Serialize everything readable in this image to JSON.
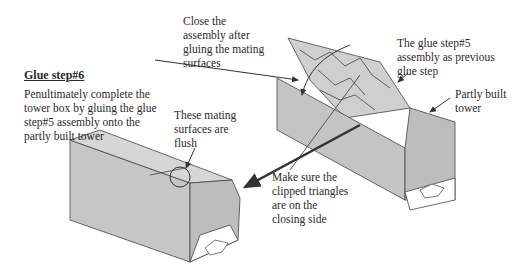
{
  "title": "Glue step#6",
  "instruction": "Penultimately complete the\ntower box by gluing the glue\nstep#5 assembly onto the\npartly built tower",
  "annotations": {
    "close_assembly": "Close the\nassembly after\ngluing the mating\nsurfaces",
    "glue_step5": "The glue step#5\nassembly as previous\nglue step",
    "partly_built": "Partly built\ntower",
    "flush": "These mating\nsurfaces are\nflush",
    "clipped_triangles": "Make sure the\nclipped triangles\nare on the\nclosing side"
  },
  "colors": {
    "panel": "#c8c8c8",
    "panel_dark": "#b4b4b4",
    "line": "#333333"
  }
}
